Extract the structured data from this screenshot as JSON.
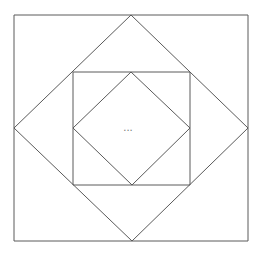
{
  "diagram": {
    "title": "",
    "stroke_color": "#5a5a5a",
    "background": "#ffffff",
    "center_label": "...",
    "shapes": {
      "outer_square": [
        [
          14,
          15
        ],
        [
          248,
          15
        ],
        [
          248,
          241
        ],
        [
          14,
          241
        ]
      ],
      "outer_diamond": [
        [
          131,
          15
        ],
        [
          248,
          128
        ],
        [
          132,
          241
        ],
        [
          14,
          128
        ]
      ],
      "inner_square": [
        [
          73,
          72
        ],
        [
          190,
          72
        ],
        [
          190,
          185
        ],
        [
          73,
          185
        ]
      ],
      "inner_diamond": [
        [
          131,
          72
        ],
        [
          190,
          128
        ],
        [
          132,
          185
        ],
        [
          73,
          128
        ]
      ]
    }
  }
}
